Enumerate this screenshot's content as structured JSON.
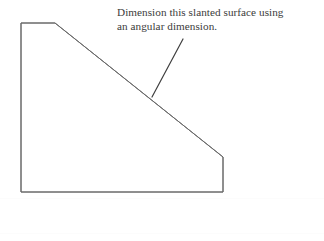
{
  "figure": {
    "background_color": "#ffffff",
    "line_color": "#666666",
    "text_color": "#3b3b3b",
    "width": 324,
    "height": 241
  },
  "annotation": {
    "line1": "Dimension this slanted surface using",
    "line2": "an angular dimension.",
    "full_text": "Dimension this slanted surface using an angular dimension."
  },
  "leader": {
    "name": "leader-line",
    "from_x": 183,
    "from_y": 39,
    "to_x": 152,
    "to_y": 97
  },
  "shape": {
    "name": "chamfered-block-outline",
    "description": "Right trapezoid block with a long slanted (chamfered) top-right surface",
    "vertices": [
      {
        "label": "top-left",
        "x": 21,
        "y": 23
      },
      {
        "label": "top-slant-start",
        "x": 55,
        "y": 23
      },
      {
        "label": "slant-end",
        "x": 223,
        "y": 157
      },
      {
        "label": "bottom-right",
        "x": 223,
        "y": 192
      },
      {
        "label": "bottom-left",
        "x": 21,
        "y": 192
      }
    ],
    "edges": [
      {
        "label": "top-edge",
        "type": "horizontal"
      },
      {
        "label": "slanted-surface",
        "type": "slanted"
      },
      {
        "label": "right-edge",
        "type": "vertical"
      },
      {
        "label": "bottom-edge",
        "type": "horizontal"
      },
      {
        "label": "left-edge",
        "type": "vertical"
      }
    ]
  }
}
